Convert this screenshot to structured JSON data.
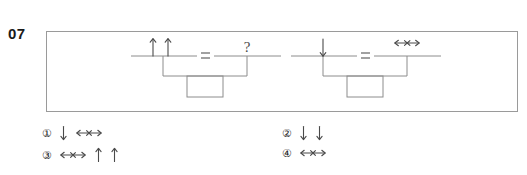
{
  "question": {
    "number": "07",
    "type": "figure-analogy"
  },
  "stimulus": {
    "panels": [
      {
        "id": "panel-left",
        "left_group": {
          "symbols": [
            "up-arrow",
            "up-arrow"
          ],
          "symbol_labels": [
            "↑",
            "↑"
          ]
        },
        "relation": "=",
        "right_group": {
          "symbols": [
            "question-mark"
          ],
          "symbol_labels": [
            "?"
          ]
        }
      },
      {
        "id": "panel-right",
        "left_group": {
          "symbols": [
            "down-arrow"
          ],
          "symbol_labels": [
            "↓"
          ]
        },
        "relation": "=",
        "right_group": {
          "symbols": [
            "horizontal-double-arrow"
          ],
          "symbol_labels": [
            "↔"
          ]
        }
      }
    ]
  },
  "options": [
    {
      "marker": "①",
      "name": "option-1",
      "glyphs": [
        "down-arrow",
        "horizontal-double-arrow"
      ],
      "glyph_labels": [
        "↓",
        "↔"
      ]
    },
    {
      "marker": "②",
      "name": "option-2",
      "glyphs": [
        "down-arrow",
        "down-arrow"
      ],
      "glyph_labels": [
        "↓",
        "↓"
      ]
    },
    {
      "marker": "③",
      "name": "option-3",
      "glyphs": [
        "horizontal-double-arrow",
        "up-arrow",
        "up-arrow"
      ],
      "glyph_labels": [
        "↔",
        "↑",
        "↑"
      ]
    },
    {
      "marker": "④",
      "name": "option-4",
      "glyphs": [
        "horizontal-double-arrow"
      ],
      "glyph_labels": [
        "↔"
      ]
    }
  ],
  "colors": {
    "ink": "#1a1a1a",
    "line": "#8c8c8c",
    "frame": "#9a9a9a",
    "background": "#ffffff"
  }
}
